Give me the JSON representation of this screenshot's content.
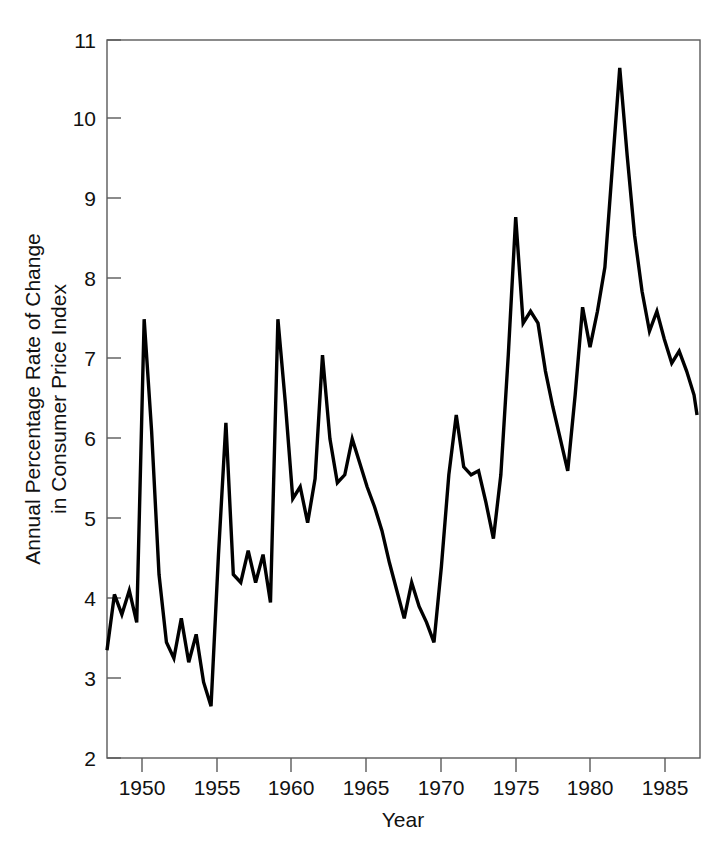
{
  "chart_data": {
    "type": "line",
    "title": "",
    "xlabel": "Year",
    "ylabel": "Annual Percentage Rate of Change in Consumer Price Index",
    "ylabel_line1": "Annual Percentage Rate of Change",
    "ylabel_line2": "in Consumer Price Index",
    "xlim": [
      1947.3,
      1987.2
    ],
    "ylim": [
      2,
      11
    ],
    "xticks": [
      1950,
      1955,
      1960,
      1965,
      1970,
      1975,
      1980,
      1985
    ],
    "xtick_labels": [
      "1950",
      "1955",
      "1960",
      "1965",
      "1970",
      "1975",
      "1980",
      "1985"
    ],
    "yticks": [
      2,
      3,
      4,
      5,
      6,
      7,
      8,
      9,
      10,
      11
    ],
    "ytick_labels": [
      "2",
      "3",
      "4",
      "5",
      "6",
      "7",
      "8",
      "9",
      "10",
      "11"
    ],
    "grid": false,
    "legend": "none",
    "line_color": "#000000",
    "frame_color": "#5a5a5a",
    "series": [
      {
        "name": "Annual Percentage Rate of Change in CPI",
        "x": [
          1947.3,
          1947.8,
          1948.3,
          1948.8,
          1949.3,
          1949.8,
          1950.3,
          1950.8,
          1951.3,
          1951.8,
          1952.3,
          1952.8,
          1953.3,
          1953.8,
          1954.3,
          1954.8,
          1955.3,
          1955.8,
          1956.3,
          1956.8,
          1957.3,
          1957.8,
          1958.3,
          1958.8,
          1959.3,
          1959.8,
          1960.3,
          1960.8,
          1961.3,
          1961.8,
          1962.3,
          1962.8,
          1963.3,
          1963.8,
          1964.3,
          1964.8,
          1965.3,
          1965.8,
          1966.3,
          1966.8,
          1967.3,
          1967.8,
          1968.3,
          1968.8,
          1969.3,
          1969.8,
          1970.3,
          1970.8,
          1971.3,
          1971.8,
          1972.3,
          1972.8,
          1973.3,
          1973.8,
          1974.3,
          1974.8,
          1975.3,
          1975.8,
          1976.3,
          1976.8,
          1977.3,
          1977.8,
          1978.3,
          1978.8,
          1979.3,
          1979.8,
          1980.3,
          1980.8,
          1981.3,
          1981.8,
          1982.3,
          1982.8,
          1983.3,
          1983.8,
          1984.3,
          1984.8,
          1985.3,
          1985.8,
          1986.3,
          1986.8,
          1987.0
        ],
        "y": [
          3.35,
          4.05,
          3.8,
          4.1,
          3.7,
          7.5,
          6.1,
          4.3,
          3.45,
          3.25,
          3.75,
          3.2,
          3.55,
          2.95,
          2.65,
          4.55,
          6.2,
          4.3,
          4.2,
          4.6,
          4.2,
          4.55,
          3.95,
          7.5,
          6.45,
          5.25,
          5.4,
          4.95,
          5.5,
          7.05,
          6.0,
          5.45,
          5.55,
          6.0,
          5.7,
          5.4,
          5.15,
          4.85,
          4.45,
          4.1,
          3.75,
          4.2,
          3.9,
          3.7,
          3.45,
          4.4,
          5.55,
          6.3,
          5.65,
          5.55,
          5.6,
          5.2,
          4.75,
          5.55,
          7.05,
          8.78,
          7.45,
          7.6,
          7.45,
          6.85,
          6.4,
          6.0,
          5.6,
          6.55,
          7.65,
          7.15,
          7.6,
          8.15,
          9.4,
          10.65,
          9.55,
          8.55,
          7.85,
          7.35,
          7.6,
          7.25,
          6.95,
          7.1,
          6.85,
          6.55,
          6.3
        ]
      }
    ]
  },
  "axes": {
    "x_title": "Year",
    "y_title_line1": "Annual Percentage Rate of Change",
    "y_title_line2": "in Consumer Price Index"
  }
}
